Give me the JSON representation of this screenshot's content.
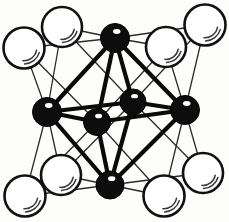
{
  "figure": {
    "title": "Octahedral M6X8 cluster",
    "width": 229,
    "height": 222,
    "background_color": "#fdfdfb"
  },
  "style": {
    "metal_fill": "#0d0d0d",
    "metal_stroke": "#000000",
    "metal_highlight": "#ffffff",
    "ligand_fill": "#ffffff",
    "ligand_stroke": "#111111",
    "ligand_highlight_stroke": "#3a3a3a",
    "strong_bond_color": "#0a0a0a",
    "weak_bond_color": "#2b2b2b",
    "strong_bond_width": 4.2,
    "weak_bond_width": 1.3
  },
  "atoms": {
    "metal_label": "metal atom (filled)",
    "ligand_label": "ligand atom (open)",
    "metal_radius": 13.5,
    "ligand_radius": 19.5,
    "metal_sites": [
      {
        "id": "m-top",
        "name": "metal-top",
        "x": 115,
        "y": 38,
        "r": 14.5
      },
      {
        "id": "m-left",
        "name": "metal-left",
        "x": 47,
        "y": 112,
        "r": 14.5
      },
      {
        "id": "m-right",
        "name": "metal-right",
        "x": 185,
        "y": 110,
        "r": 14.5
      },
      {
        "id": "m-bottom",
        "name": "metal-bottom",
        "x": 110,
        "y": 185,
        "r": 14.0
      },
      {
        "id": "m-front",
        "name": "metal-front-center",
        "x": 97,
        "y": 122,
        "r": 13.5
      },
      {
        "id": "m-back",
        "name": "metal-back-center",
        "x": 133,
        "y": 102,
        "r": 13.0
      }
    ],
    "ligand_sites": [
      {
        "id": "l-tl-back",
        "name": "ligand-top-left-back",
        "x": 62,
        "y": 27,
        "r": 20.0
      },
      {
        "id": "l-tl-front",
        "name": "ligand-top-left-front",
        "x": 24,
        "y": 48,
        "r": 20.5
      },
      {
        "id": "l-tr-back",
        "name": "ligand-top-right-back",
        "x": 205,
        "y": 25,
        "r": 20.5
      },
      {
        "id": "l-tr-front",
        "name": "ligand-top-right-front",
        "x": 166,
        "y": 47,
        "r": 20.0
      },
      {
        "id": "l-bl-back",
        "name": "ligand-bottom-left-back",
        "x": 61,
        "y": 175,
        "r": 20.0
      },
      {
        "id": "l-bl-front",
        "name": "ligand-bottom-left-front",
        "x": 25,
        "y": 196,
        "r": 20.5
      },
      {
        "id": "l-br-back",
        "name": "ligand-bottom-right-back",
        "x": 203,
        "y": 173,
        "r": 20.0
      },
      {
        "id": "l-br-front",
        "name": "ligand-bottom-right-front",
        "x": 164,
        "y": 196,
        "r": 20.5
      }
    ]
  },
  "bonds": {
    "strong_label": "metal-metal bond",
    "weak_label": "metal-ligand bond",
    "strong": [
      [
        "m-top",
        "m-left"
      ],
      [
        "m-top",
        "m-right"
      ],
      [
        "m-top",
        "m-front"
      ],
      [
        "m-top",
        "m-back"
      ],
      [
        "m-bottom",
        "m-left"
      ],
      [
        "m-bottom",
        "m-right"
      ],
      [
        "m-bottom",
        "m-front"
      ],
      [
        "m-bottom",
        "m-back"
      ],
      [
        "m-left",
        "m-front"
      ],
      [
        "m-left",
        "m-back"
      ],
      [
        "m-right",
        "m-front"
      ],
      [
        "m-right",
        "m-back"
      ]
    ],
    "weak": [
      [
        "l-tl-back",
        "m-top"
      ],
      [
        "l-tl-back",
        "m-left"
      ],
      [
        "l-tl-back",
        "m-back"
      ],
      [
        "l-tl-front",
        "m-top"
      ],
      [
        "l-tl-front",
        "m-left"
      ],
      [
        "l-tl-front",
        "m-front"
      ],
      [
        "l-tr-back",
        "m-top"
      ],
      [
        "l-tr-back",
        "m-right"
      ],
      [
        "l-tr-back",
        "m-back"
      ],
      [
        "l-tr-front",
        "m-top"
      ],
      [
        "l-tr-front",
        "m-right"
      ],
      [
        "l-tr-front",
        "m-front"
      ],
      [
        "l-bl-back",
        "m-bottom"
      ],
      [
        "l-bl-back",
        "m-left"
      ],
      [
        "l-bl-back",
        "m-back"
      ],
      [
        "l-bl-front",
        "m-bottom"
      ],
      [
        "l-bl-front",
        "m-left"
      ],
      [
        "l-bl-front",
        "m-front"
      ],
      [
        "l-br-back",
        "m-bottom"
      ],
      [
        "l-br-back",
        "m-right"
      ],
      [
        "l-br-back",
        "m-back"
      ],
      [
        "l-br-front",
        "m-bottom"
      ],
      [
        "l-br-front",
        "m-right"
      ],
      [
        "l-br-front",
        "m-front"
      ]
    ]
  }
}
